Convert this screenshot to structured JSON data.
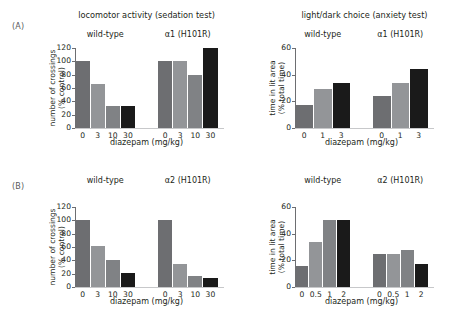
{
  "figure": {
    "panels": [
      {
        "letter": "(A)",
        "charts": [
          {
            "id": "a-locomotor",
            "suptitle": "locomotor activity (sedation test)",
            "ylabel_line1": "number of crossings",
            "ylabel_line2": "(% control)",
            "xlabel": "diazepam (mg/kg)",
            "groups": [
              {
                "name": "wild-type",
                "ticks": [
                  "0",
                  "3",
                  "10",
                  "30"
                ],
                "values": [
                  100,
                  66,
                  33,
                  33
                ]
              },
              {
                "name": "α1 (H101R)",
                "ticks": [
                  "0",
                  "3",
                  "10",
                  "30"
                ],
                "values": [
                  100,
                  100,
                  80,
                  120
                ]
              }
            ],
            "yticks": [
              "0",
              "20",
              "40",
              "60",
              "80",
              "100",
              "120"
            ],
            "ymax": 120
          },
          {
            "id": "a-lightdark",
            "suptitle": "light/dark choice (anxiety test)",
            "ylabel_line1": "time in lit area",
            "ylabel_line2": "(% total time)",
            "xlabel": "diazepam (mg/kg)",
            "groups": [
              {
                "name": "wild-type",
                "ticks": [
                  "0",
                  "1",
                  "3"
                ],
                "values": [
                  17,
                  29,
                  34
                ]
              },
              {
                "name": "α1 (H101R)",
                "ticks": [
                  "0",
                  "1",
                  "3"
                ],
                "values": [
                  24,
                  34,
                  44
                ]
              }
            ],
            "yticks": [
              "0",
              "20",
              "40",
              "60"
            ],
            "ymax": 60
          }
        ]
      },
      {
        "letter": "(B)",
        "charts": [
          {
            "id": "b-locomotor",
            "suptitle": "",
            "ylabel_line1": "number of crossings",
            "ylabel_line2": "(% control)",
            "xlabel": "diazepam (mg/kg)",
            "groups": [
              {
                "name": "wild-type",
                "ticks": [
                  "0",
                  "3",
                  "10",
                  "30"
                ],
                "values": [
                  100,
                  61,
                  40,
                  21
                ]
              },
              {
                "name": "α2 (H101R)",
                "ticks": [
                  "0",
                  "3",
                  "10",
                  "30"
                ],
                "values": [
                  100,
                  34,
                  17,
                  14
                ]
              }
            ],
            "yticks": [
              "0",
              "20",
              "40",
              "60",
              "80",
              "100",
              "120"
            ],
            "ymax": 120
          },
          {
            "id": "b-lightdark",
            "suptitle": "",
            "ylabel_line1": "time in lit area",
            "ylabel_line2": "(% total time)",
            "xlabel": "diazepam (mg/kg)",
            "groups": [
              {
                "name": "wild-type",
                "ticks": [
                  "0",
                  "0.5",
                  "1",
                  "2"
                ],
                "values": [
                  16,
                  33.5,
                  50,
                  50
                ]
              },
              {
                "name": "α2 (H101R)",
                "ticks": [
                  "0",
                  "0.5",
                  "1",
                  "2"
                ],
                "values": [
                  25,
                  25,
                  28,
                  17
                ]
              }
            ],
            "yticks": [
              "0",
              "20",
              "40",
              "60"
            ],
            "ymax": 60
          }
        ]
      }
    ]
  },
  "colors": {
    "bar_dose0": "#6d6e71",
    "bar_dose1": "#939598",
    "bar_dose2": "#808285",
    "bar_dose_high": "#1a1a1a",
    "axis": "#6d6e71",
    "text": "#231f20"
  },
  "chart_data": [
    {
      "type": "bar",
      "title": "locomotor activity (sedation test)",
      "panel": "(A)",
      "xlabel": "diazepam (mg/kg)",
      "ylabel": "number of crossings (% control)",
      "ylim": [
        0,
        120
      ],
      "yticks": [
        0,
        20,
        40,
        60,
        80,
        100,
        120
      ],
      "grid": false,
      "legend": "none",
      "categories": [
        "0",
        "3",
        "10",
        "30"
      ],
      "series": [
        {
          "name": "wild-type",
          "values": [
            100,
            66,
            33,
            33
          ]
        },
        {
          "name": "α1 (H101R)",
          "values": [
            100,
            100,
            80,
            120
          ]
        }
      ]
    },
    {
      "type": "bar",
      "title": "light/dark choice (anxiety test)",
      "panel": "(A)",
      "xlabel": "diazepam (mg/kg)",
      "ylabel": "time in lit area (% total time)",
      "ylim": [
        0,
        60
      ],
      "yticks": [
        0,
        20,
        40,
        60
      ],
      "grid": false,
      "legend": "none",
      "categories": [
        "0",
        "1",
        "3"
      ],
      "series": [
        {
          "name": "wild-type",
          "values": [
            17,
            29,
            34
          ]
        },
        {
          "name": "α1 (H101R)",
          "values": [
            24,
            34,
            44
          ]
        }
      ]
    },
    {
      "type": "bar",
      "title": "locomotor activity (sedation test)",
      "panel": "(B)",
      "xlabel": "diazepam (mg/kg)",
      "ylabel": "number of crossings (% control)",
      "ylim": [
        0,
        120
      ],
      "yticks": [
        0,
        20,
        40,
        60,
        80,
        100,
        120
      ],
      "grid": false,
      "legend": "none",
      "categories": [
        "0",
        "3",
        "10",
        "30"
      ],
      "series": [
        {
          "name": "wild-type",
          "values": [
            100,
            61,
            40,
            21
          ]
        },
        {
          "name": "α2 (H101R)",
          "values": [
            100,
            34,
            17,
            14
          ]
        }
      ]
    },
    {
      "type": "bar",
      "title": "light/dark choice (anxiety test)",
      "panel": "(B)",
      "xlabel": "diazepam (mg/kg)",
      "ylabel": "time in lit area (% total time)",
      "ylim": [
        0,
        60
      ],
      "yticks": [
        0,
        20,
        40,
        60
      ],
      "grid": false,
      "legend": "none",
      "categories": [
        "0",
        "0.5",
        "1",
        "2"
      ],
      "series": [
        {
          "name": "wild-type",
          "values": [
            16,
            33.5,
            50,
            50
          ]
        },
        {
          "name": "α2 (H101R)",
          "values": [
            25,
            25,
            28,
            17
          ]
        }
      ]
    }
  ]
}
